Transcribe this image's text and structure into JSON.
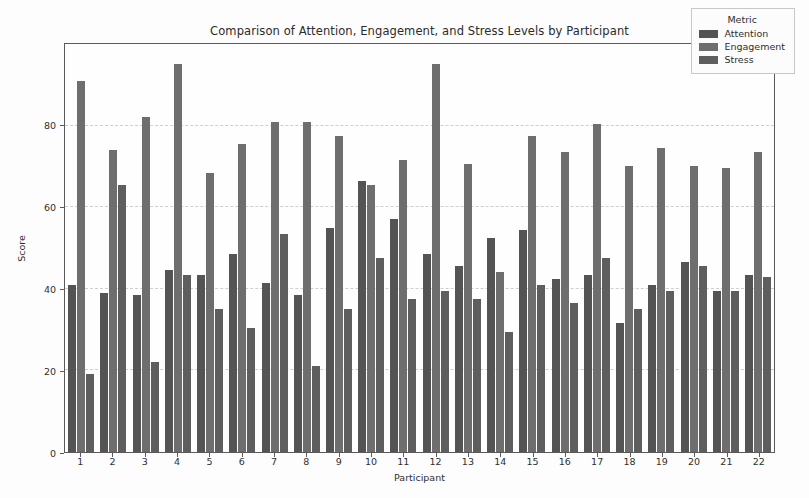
{
  "chart_data": {
    "type": "bar",
    "title": "Comparison of Attention, Engagement, and Stress Levels by Participant",
    "xlabel": "Participant",
    "ylabel": "Score",
    "ylim": [
      0,
      100
    ],
    "yticks": [
      0,
      20,
      40,
      60,
      80
    ],
    "grid": true,
    "legend_title": "Metric",
    "legend_position": "upper right",
    "categories": [
      "1",
      "2",
      "3",
      "4",
      "5",
      "6",
      "7",
      "8",
      "9",
      "10",
      "11",
      "12",
      "13",
      "14",
      "15",
      "16",
      "17",
      "18",
      "19",
      "20",
      "21",
      "22"
    ],
    "series": [
      {
        "name": "Attention",
        "color": "#545454",
        "values": [
          41.0,
          39.0,
          38.5,
          44.5,
          43.5,
          48.5,
          41.5,
          38.5,
          55.0,
          66.5,
          57.0,
          48.5,
          45.5,
          52.5,
          54.5,
          42.5,
          43.5,
          31.5,
          41.0,
          46.5,
          39.5,
          43.5
        ]
      },
      {
        "name": "Engagement",
        "color": "#6e6e6e",
        "values": [
          91.0,
          74.0,
          82.0,
          95.0,
          68.5,
          75.5,
          81.0,
          81.0,
          77.5,
          65.5,
          71.5,
          95.0,
          70.5,
          44.0,
          77.5,
          73.5,
          80.5,
          70.0,
          74.5,
          70.0,
          69.5,
          73.5
        ]
      },
      {
        "name": "Stress",
        "color": "#5e5e5e",
        "values": [
          19.0,
          65.5,
          22.0,
          43.5,
          35.0,
          30.5,
          53.5,
          21.0,
          35.0,
          47.5,
          37.5,
          39.5,
          37.5,
          29.5,
          41.0,
          36.5,
          47.5,
          35.0,
          39.5,
          45.5,
          39.5,
          43.0
        ]
      }
    ]
  }
}
